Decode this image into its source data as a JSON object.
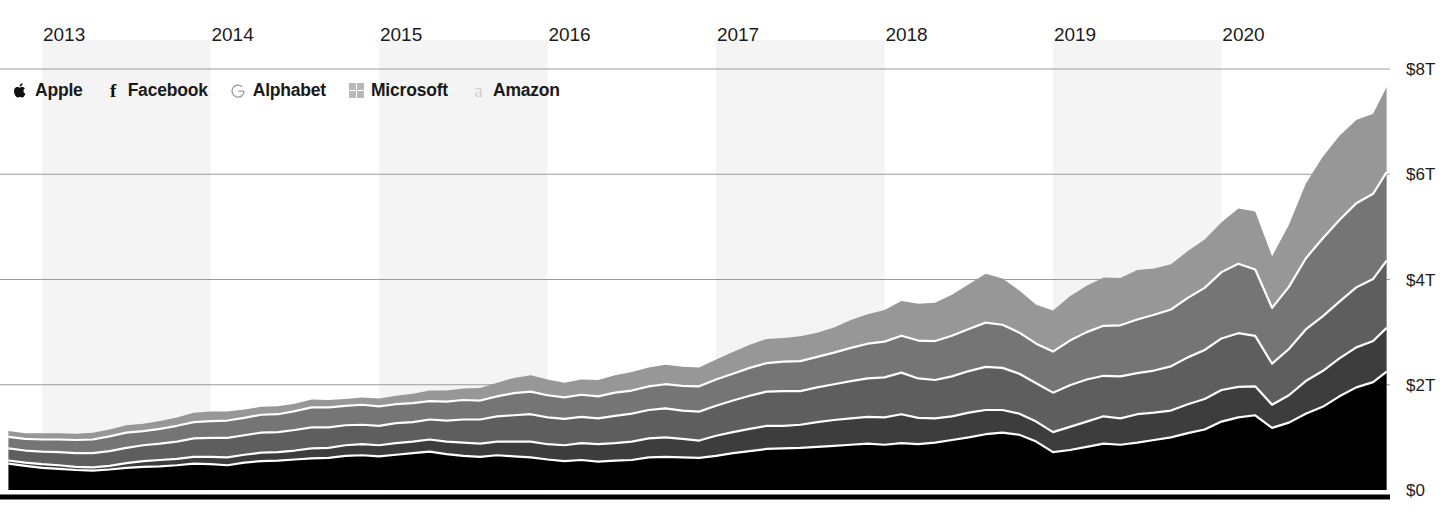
{
  "chart_data": {
    "type": "area",
    "title": "",
    "subtitle": "",
    "xlabel": "",
    "ylabel": "",
    "stacked": true,
    "grid": true,
    "legend_position": "top-left",
    "ylim": [
      0,
      8
    ],
    "y_unit": "trillions USD",
    "y_ticks": [
      0,
      2,
      4,
      6,
      8
    ],
    "y_ticklabels": [
      "$0",
      "$2T",
      "$4T",
      "$6T",
      "$8T"
    ],
    "x_ticks": [
      2013,
      2014,
      2015,
      2016,
      2017,
      2018,
      2019,
      2020
    ],
    "x_ticklabels": [
      "2013",
      "2014",
      "2015",
      "2016",
      "2017",
      "2018",
      "2019",
      "2020"
    ],
    "xlim": [
      2012.75,
      2021.0
    ],
    "legend": [
      {
        "name": "Apple",
        "icon": "apple-logo-icon",
        "color": "#000000"
      },
      {
        "name": "Facebook",
        "icon": "facebook-f-icon",
        "color": "#3d3d3d"
      },
      {
        "name": "Alphabet",
        "icon": "google-g-icon",
        "color": "#5e5e5e"
      },
      {
        "name": "Microsoft",
        "icon": "microsoft-squares-icon",
        "color": "#757575"
      },
      {
        "name": "Amazon",
        "icon": "amazon-a-icon",
        "color": "#979797"
      }
    ],
    "x": [
      2012.8,
      2012.9,
      2013.0,
      2013.1,
      2013.2,
      2013.3,
      2013.4,
      2013.5,
      2013.6,
      2013.7,
      2013.8,
      2013.9,
      2014.0,
      2014.1,
      2014.2,
      2014.3,
      2014.4,
      2014.5,
      2014.6,
      2014.7,
      2014.8,
      2014.9,
      2015.0,
      2015.1,
      2015.2,
      2015.3,
      2015.4,
      2015.5,
      2015.6,
      2015.7,
      2015.8,
      2015.9,
      2016.0,
      2016.1,
      2016.2,
      2016.3,
      2016.4,
      2016.5,
      2016.6,
      2016.7,
      2016.8,
      2016.9,
      2017.0,
      2017.1,
      2017.2,
      2017.3,
      2017.4,
      2017.5,
      2017.6,
      2017.7,
      2017.8,
      2017.9,
      2018.0,
      2018.1,
      2018.2,
      2018.3,
      2018.4,
      2018.5,
      2018.6,
      2018.7,
      2018.8,
      2018.9,
      2019.0,
      2019.1,
      2019.2,
      2019.3,
      2019.4,
      2019.5,
      2019.6,
      2019.7,
      2019.8,
      2019.9,
      2020.0,
      2020.1,
      2020.2,
      2020.3,
      2020.4,
      2020.5,
      2020.6,
      2020.7,
      2020.8,
      2020.9,
      2020.98
    ],
    "series": [
      {
        "name": "Apple",
        "color": "#000000",
        "values": [
          0.5,
          0.46,
          0.42,
          0.4,
          0.38,
          0.37,
          0.39,
          0.42,
          0.44,
          0.45,
          0.47,
          0.5,
          0.49,
          0.47,
          0.52,
          0.55,
          0.56,
          0.58,
          0.6,
          0.61,
          0.65,
          0.66,
          0.64,
          0.67,
          0.7,
          0.73,
          0.68,
          0.65,
          0.63,
          0.66,
          0.64,
          0.62,
          0.58,
          0.55,
          0.57,
          0.54,
          0.56,
          0.57,
          0.62,
          0.63,
          0.62,
          0.61,
          0.65,
          0.7,
          0.74,
          0.78,
          0.79,
          0.8,
          0.82,
          0.84,
          0.86,
          0.88,
          0.86,
          0.89,
          0.87,
          0.9,
          0.95,
          1.0,
          1.06,
          1.09,
          1.05,
          0.92,
          0.72,
          0.76,
          0.82,
          0.88,
          0.86,
          0.9,
          0.95,
          1.0,
          1.08,
          1.15,
          1.3,
          1.38,
          1.42,
          1.18,
          1.28,
          1.45,
          1.58,
          1.78,
          1.95,
          2.05,
          2.25
        ]
      },
      {
        "name": "Facebook",
        "color": "#3d3d3d",
        "values": [
          0.06,
          0.06,
          0.07,
          0.07,
          0.06,
          0.06,
          0.07,
          0.09,
          0.11,
          0.12,
          0.12,
          0.13,
          0.14,
          0.15,
          0.15,
          0.16,
          0.16,
          0.17,
          0.19,
          0.19,
          0.2,
          0.21,
          0.21,
          0.22,
          0.22,
          0.23,
          0.24,
          0.25,
          0.25,
          0.26,
          0.28,
          0.3,
          0.29,
          0.3,
          0.32,
          0.33,
          0.33,
          0.35,
          0.36,
          0.37,
          0.35,
          0.33,
          0.38,
          0.4,
          0.42,
          0.44,
          0.43,
          0.44,
          0.47,
          0.49,
          0.5,
          0.51,
          0.52,
          0.55,
          0.5,
          0.46,
          0.45,
          0.47,
          0.46,
          0.43,
          0.4,
          0.38,
          0.38,
          0.44,
          0.48,
          0.52,
          0.5,
          0.54,
          0.52,
          0.51,
          0.55,
          0.58,
          0.6,
          0.58,
          0.55,
          0.44,
          0.52,
          0.62,
          0.68,
          0.72,
          0.76,
          0.78,
          0.83
        ]
      },
      {
        "name": "Alphabet",
        "color": "#5e5e5e",
        "values": [
          0.23,
          0.23,
          0.24,
          0.25,
          0.26,
          0.27,
          0.28,
          0.29,
          0.3,
          0.31,
          0.33,
          0.35,
          0.36,
          0.37,
          0.37,
          0.38,
          0.38,
          0.39,
          0.4,
          0.39,
          0.38,
          0.37,
          0.37,
          0.38,
          0.37,
          0.38,
          0.4,
          0.44,
          0.46,
          0.48,
          0.5,
          0.52,
          0.51,
          0.5,
          0.5,
          0.49,
          0.52,
          0.53,
          0.54,
          0.55,
          0.54,
          0.55,
          0.57,
          0.6,
          0.63,
          0.65,
          0.66,
          0.64,
          0.66,
          0.68,
          0.71,
          0.73,
          0.76,
          0.79,
          0.75,
          0.73,
          0.76,
          0.79,
          0.82,
          0.8,
          0.76,
          0.73,
          0.75,
          0.79,
          0.8,
          0.77,
          0.8,
          0.78,
          0.8,
          0.84,
          0.89,
          0.93,
          0.98,
          1.02,
          0.96,
          0.78,
          0.88,
          0.98,
          1.04,
          1.08,
          1.14,
          1.18,
          1.28
        ]
      },
      {
        "name": "Microsoft",
        "color": "#757575",
        "values": [
          0.22,
          0.22,
          0.23,
          0.24,
          0.25,
          0.26,
          0.28,
          0.29,
          0.27,
          0.28,
          0.3,
          0.31,
          0.32,
          0.33,
          0.33,
          0.34,
          0.34,
          0.36,
          0.38,
          0.38,
          0.37,
          0.38,
          0.37,
          0.36,
          0.36,
          0.35,
          0.36,
          0.37,
          0.36,
          0.38,
          0.42,
          0.43,
          0.42,
          0.41,
          0.42,
          0.42,
          0.44,
          0.44,
          0.45,
          0.46,
          0.47,
          0.48,
          0.5,
          0.51,
          0.53,
          0.54,
          0.56,
          0.57,
          0.58,
          0.6,
          0.63,
          0.66,
          0.68,
          0.7,
          0.72,
          0.74,
          0.77,
          0.8,
          0.84,
          0.82,
          0.78,
          0.75,
          0.78,
          0.85,
          0.9,
          0.95,
          0.97,
          1.02,
          1.06,
          1.08,
          1.13,
          1.18,
          1.26,
          1.32,
          1.26,
          1.06,
          1.18,
          1.35,
          1.48,
          1.55,
          1.6,
          1.62,
          1.68
        ]
      },
      {
        "name": "Amazon",
        "color": "#979797",
        "values": [
          0.11,
          0.11,
          0.12,
          0.12,
          0.12,
          0.13,
          0.13,
          0.14,
          0.14,
          0.15,
          0.16,
          0.18,
          0.18,
          0.17,
          0.16,
          0.15,
          0.15,
          0.14,
          0.15,
          0.14,
          0.13,
          0.14,
          0.15,
          0.16,
          0.18,
          0.2,
          0.21,
          0.22,
          0.24,
          0.26,
          0.29,
          0.31,
          0.3,
          0.28,
          0.29,
          0.31,
          0.33,
          0.35,
          0.36,
          0.37,
          0.36,
          0.36,
          0.38,
          0.41,
          0.44,
          0.46,
          0.45,
          0.47,
          0.46,
          0.48,
          0.53,
          0.56,
          0.6,
          0.66,
          0.7,
          0.73,
          0.78,
          0.85,
          0.93,
          0.88,
          0.8,
          0.74,
          0.78,
          0.84,
          0.88,
          0.92,
          0.9,
          0.94,
          0.88,
          0.86,
          0.89,
          0.92,
          0.95,
          1.05,
          1.1,
          0.98,
          1.18,
          1.42,
          1.55,
          1.6,
          1.58,
          1.52,
          1.62
        ]
      }
    ],
    "bands": [
      {
        "label": "2013",
        "x0": 2013.0,
        "x1": 2014.0
      },
      {
        "label": "2015",
        "x0": 2015.0,
        "x1": 2016.0
      },
      {
        "label": "2017",
        "x0": 2017.0,
        "x1": 2018.0
      },
      {
        "label": "2019",
        "x0": 2019.0,
        "x1": 2020.0
      }
    ]
  }
}
